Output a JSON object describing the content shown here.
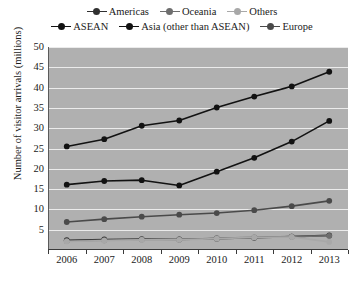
{
  "chart_data": {
    "type": "line",
    "title": "",
    "xlabel": "",
    "ylabel": "Number of visitor arrivals (millions)",
    "categories": [
      "2006",
      "2007",
      "2008",
      "2009",
      "2010",
      "2011",
      "2012",
      "2013"
    ],
    "x": [
      2006,
      2007,
      2008,
      2009,
      2010,
      2011,
      2012,
      2013
    ],
    "ylim": [
      0,
      50
    ],
    "yticks": [
      5,
      10,
      15,
      20,
      25,
      30,
      35,
      40,
      45,
      50
    ],
    "grid": true,
    "legend_position": "top",
    "series": [
      {
        "name": "Americas",
        "color": "#303030",
        "values": [
          2.4,
          2.6,
          2.7,
          2.6,
          2.8,
          3.0,
          3.3,
          3.6
        ]
      },
      {
        "name": "Oceania",
        "color": "#6e6e6e",
        "values": [
          2.2,
          2.4,
          2.6,
          2.6,
          2.9,
          3.1,
          3.3,
          3.5
        ]
      },
      {
        "name": "Others",
        "color": "#a8a8a8",
        "values": [
          2.1,
          2.3,
          2.5,
          2.5,
          2.8,
          3.1,
          3.2,
          2.0
        ]
      },
      {
        "name": "ASEAN",
        "color": "#121212",
        "values": [
          16.1,
          17.0,
          17.2,
          15.9,
          19.3,
          22.7,
          26.7,
          31.8
        ]
      },
      {
        "name": "Asia (other than ASEAN)",
        "color": "#121212",
        "values": [
          25.5,
          27.3,
          30.6,
          31.9,
          35.1,
          37.8,
          40.3,
          43.9
        ]
      },
      {
        "name": "Europe",
        "color": "#4a4a4a",
        "values": [
          6.9,
          7.6,
          8.2,
          8.7,
          9.1,
          9.8,
          10.8,
          12.1
        ]
      }
    ],
    "legend": [
      [
        {
          "label": "Americas",
          "color": "#303030"
        },
        {
          "label": "Oceania",
          "color": "#6e6e6e"
        },
        {
          "label": "Others",
          "color": "#a8a8a8"
        }
      ],
      [
        {
          "label": "ASEAN",
          "color": "#121212"
        },
        {
          "label": "Asia (other than ASEAN)",
          "color": "#121212"
        },
        {
          "label": "Europe",
          "color": "#4a4a4a"
        }
      ]
    ]
  }
}
